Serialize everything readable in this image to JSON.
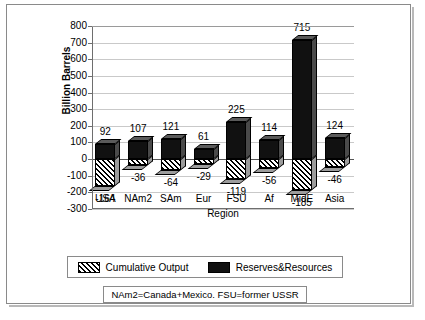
{
  "chart_data": {
    "type": "bar",
    "title": "",
    "xlabel": "Region",
    "ylabel": "Billion Barrels",
    "ylim": [
      -300,
      800
    ],
    "ytick_values": [
      800,
      700,
      600,
      500,
      400,
      300,
      200,
      100,
      0,
      -100,
      -200,
      -300
    ],
    "ytick_labels": [
      "800",
      "700",
      "600",
      "500",
      "400",
      "300",
      "200",
      "100",
      "0",
      "-100",
      "-200",
      "-300"
    ],
    "categories": [
      "USA",
      "NAm2",
      "SAm",
      "Eur",
      "FSU",
      "Af",
      "MidE",
      "Asia"
    ],
    "grid": true,
    "legend_position": "bottom",
    "series": [
      {
        "name": "Cumulative Output",
        "style": "hatched",
        "values": [
          -164,
          -36,
          -64,
          -29,
          -119,
          -56,
          -185,
          -46
        ],
        "labels": [
          "-164",
          "-36",
          "-64",
          "-29",
          "-119",
          "-56",
          "-185",
          "-46"
        ]
      },
      {
        "name": "Reserves&Resources",
        "style": "solid-black",
        "values": [
          92,
          107,
          121,
          61,
          225,
          114,
          715,
          124
        ],
        "labels": [
          "92",
          "107",
          "121",
          "61",
          "225",
          "114",
          "715",
          "124"
        ]
      }
    ],
    "annotation": "NAm2=Canada+Mexico.  FSU=former USSR"
  },
  "legend": {
    "items": [
      {
        "label": "Cumulative Output",
        "swatch": "hatch"
      },
      {
        "label": "Reserves&Resources",
        "swatch": "solid"
      }
    ]
  },
  "footnote": {
    "text": "NAm2=Canada+Mexico.  FSU=former USSR"
  },
  "colors": {
    "bar_solid": "#111111",
    "grid": "#c9c9c9",
    "axis": "#6e6e6e",
    "frame": "#8a8a8a"
  }
}
